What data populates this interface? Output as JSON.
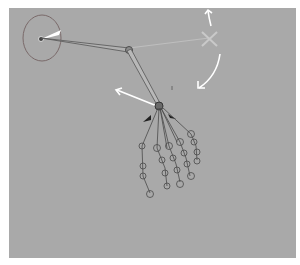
{
  "viewport": {
    "background": "#a9a9a9",
    "label": "3D viewport - hand rig with IK controls"
  },
  "colors": {
    "bone": "#555555",
    "bone_light": "#d8d8d8",
    "arrow": "#ffffff",
    "ik_circle": "#7a6a6a",
    "target_x": "#c8c8c8",
    "joint": "#5a5a5a"
  },
  "scene": {
    "shoulder_control": "circle-controller",
    "upper_arm": "bone",
    "forearm": "bone",
    "wrist": "joint",
    "fingers": 5,
    "pole_target": "x-marker",
    "arrows": [
      "move-up-arrow",
      "rotate-down-arrow",
      "move-left-arrow"
    ]
  }
}
